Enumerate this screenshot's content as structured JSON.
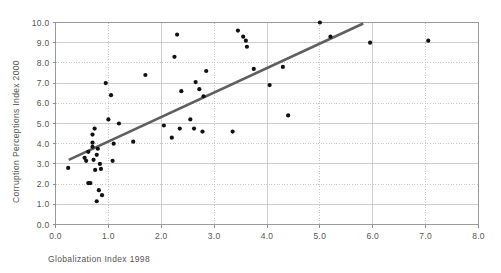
{
  "chart_data": {
    "type": "scatter",
    "title": "",
    "xlabel": "Globalization Index 1998",
    "ylabel": "Corruption Perceptions Index 2000",
    "xlim": [
      0.0,
      8.0
    ],
    "ylim": [
      0.0,
      10.0
    ],
    "xticks": [
      "0.0",
      "1.0",
      "2.0",
      "3.0",
      "4.0",
      "5.0",
      "6.0",
      "7.0",
      "8.0"
    ],
    "yticks": [
      "0.0",
      "1.0",
      "2.0",
      "3.0",
      "4.0",
      "5.0",
      "6.0",
      "7.0",
      "8.0",
      "9.0",
      "10.0"
    ],
    "xtick_values": [
      0.0,
      1.0,
      2.0,
      3.0,
      4.0,
      5.0,
      6.0,
      7.0,
      8.0
    ],
    "ytick_values": [
      0.0,
      1.0,
      2.0,
      3.0,
      4.0,
      5.0,
      6.0,
      7.0,
      8.0,
      9.0,
      10.0
    ],
    "grid": true,
    "legend": null,
    "marker": "filled-circle",
    "marker_color": "#111111",
    "points": [
      [
        0.24,
        2.8
      ],
      [
        0.55,
        3.3
      ],
      [
        0.58,
        3.15
      ],
      [
        0.62,
        3.6
      ],
      [
        0.62,
        2.05
      ],
      [
        0.66,
        2.05
      ],
      [
        0.7,
        4.45
      ],
      [
        0.7,
        4.05
      ],
      [
        0.7,
        3.85
      ],
      [
        0.72,
        3.2
      ],
      [
        0.74,
        4.75
      ],
      [
        0.75,
        2.7
      ],
      [
        0.78,
        3.45
      ],
      [
        0.78,
        1.15
      ],
      [
        0.8,
        3.75
      ],
      [
        0.82,
        1.7
      ],
      [
        0.84,
        3.0
      ],
      [
        0.86,
        2.75
      ],
      [
        0.88,
        1.45
      ],
      [
        0.95,
        7.0
      ],
      [
        1.0,
        5.2
      ],
      [
        1.05,
        6.4
      ],
      [
        1.08,
        3.15
      ],
      [
        1.1,
        4.0
      ],
      [
        1.2,
        5.0
      ],
      [
        1.47,
        4.1
      ],
      [
        1.7,
        7.4
      ],
      [
        2.05,
        4.9
      ],
      [
        2.2,
        4.3
      ],
      [
        2.25,
        8.3
      ],
      [
        2.3,
        9.4
      ],
      [
        2.35,
        4.75
      ],
      [
        2.38,
        6.6
      ],
      [
        2.55,
        5.2
      ],
      [
        2.62,
        4.75
      ],
      [
        2.65,
        7.05
      ],
      [
        2.72,
        6.7
      ],
      [
        2.78,
        4.6
      ],
      [
        2.8,
        6.35
      ],
      [
        2.85,
        7.6
      ],
      [
        3.35,
        4.6
      ],
      [
        3.45,
        9.6
      ],
      [
        3.55,
        9.3
      ],
      [
        3.6,
        9.1
      ],
      [
        3.62,
        8.8
      ],
      [
        3.75,
        7.7
      ],
      [
        4.05,
        6.9
      ],
      [
        4.3,
        7.8
      ],
      [
        4.4,
        5.4
      ],
      [
        5.0,
        10.0
      ],
      [
        5.2,
        9.3
      ],
      [
        5.95,
        9.0
      ],
      [
        7.05,
        9.1
      ]
    ],
    "trend_line": {
      "x0": 0.25,
      "y0": 3.2,
      "x1": 5.82,
      "y1": 9.95,
      "color": "#5f5f5f"
    }
  }
}
